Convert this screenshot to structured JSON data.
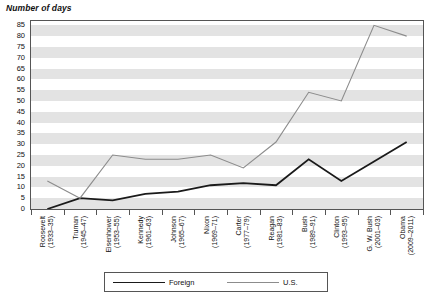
{
  "chart_data": {
    "type": "line",
    "title": "Number of days",
    "ylabel": "Number of days",
    "xlabel": "",
    "ylim": [
      0,
      87
    ],
    "yticks": [
      0,
      5,
      10,
      15,
      20,
      25,
      30,
      35,
      40,
      45,
      50,
      55,
      60,
      65,
      70,
      75,
      80,
      85
    ],
    "grid": true,
    "legend_position": "bottom",
    "categories": [
      "Roosevelt (1933–35)",
      "Truman (1945–47)",
      "Eisenhower (1953–55)",
      "Kennedy (1961–63)",
      "Johnson (1965–67)",
      "Nixon (1969–71)",
      "Carter (1977–79)",
      "Reagan (1981–83)",
      "Bush (1989–91)",
      "Clinton (1993–95)",
      "G. W. Bush (2001–03)",
      "Obama (2009–2011)"
    ],
    "category_lines": [
      [
        "Roosevelt",
        "(1933–35)"
      ],
      [
        "Truman",
        "(1945–47)"
      ],
      [
        "Eisenhower",
        "(1953–55)"
      ],
      [
        "Kennedy",
        "(1961–63)"
      ],
      [
        "Johnson",
        "(1965–67)"
      ],
      [
        "Nixon",
        "(1969–71)"
      ],
      [
        "Carter",
        "(1977–79)"
      ],
      [
        "Reagan",
        "(1981–83)"
      ],
      [
        "Bush",
        "(1989–91)"
      ],
      [
        "Clinton",
        "(1993–95)"
      ],
      [
        "G. W. Bush",
        "(2001–03)"
      ],
      [
        "Obama",
        "(2009–2011)"
      ]
    ],
    "series": [
      {
        "name": "Foreign",
        "color": "#1a1a1a",
        "values": [
          0,
          5,
          4,
          7,
          8,
          11,
          12,
          11,
          23,
          13,
          22,
          31
        ]
      },
      {
        "name": "U.S.",
        "color": "#8c8c8c",
        "values": [
          13,
          5,
          25,
          23,
          23,
          25,
          19,
          31,
          54,
          50,
          85,
          80
        ]
      }
    ]
  },
  "legend": {
    "foreign_label": "Foreign",
    "us_label": "U.S."
  }
}
